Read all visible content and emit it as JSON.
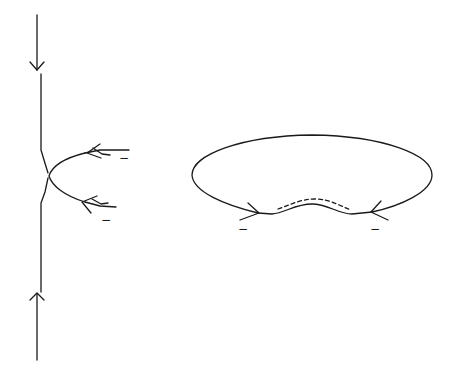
{
  "diagram": {
    "background": "#ffffff",
    "stroke_color": "#1a1a1a",
    "left_figure": {
      "description": "vertical line with downward arrow at top, upward arrow at bottom, and a U-shaped branch curve at middle with two incoming arrows from the right",
      "labels": [
        "−",
        "−"
      ]
    },
    "right_figure": {
      "description": "closed elliptical loop with a wavy bottom segment, dashed parallel curve above the wave, and two incoming arrows at the bottom corners",
      "labels": [
        "−",
        "−"
      ]
    }
  }
}
